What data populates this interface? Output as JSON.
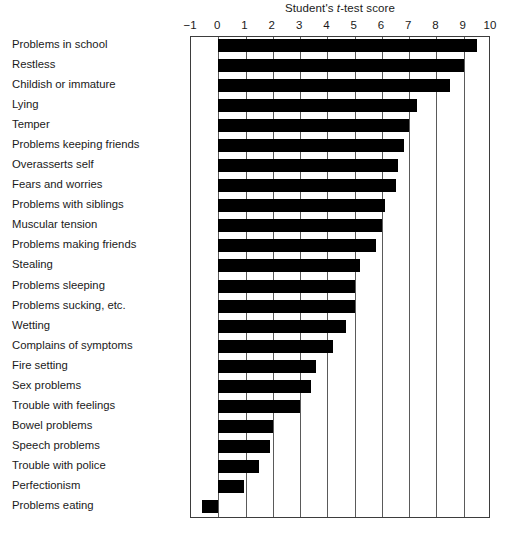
{
  "chart_data": {
    "type": "bar",
    "orientation": "horizontal",
    "title": "Student's t-test score",
    "title_parts": {
      "before": "Student's ",
      "italic": "t",
      "after": "-test score"
    },
    "xlabel": "Student's t-test score",
    "ylabel": "",
    "xlim": [
      -1,
      10
    ],
    "xticks": [
      -1,
      0,
      1,
      2,
      3,
      4,
      5,
      6,
      7,
      8,
      9,
      10
    ],
    "xtick_labels": [
      "−1",
      "0",
      "1",
      "2",
      "3",
      "4",
      "5",
      "6",
      "7",
      "8",
      "9",
      "10"
    ],
    "grid": "vertical",
    "legend": "none",
    "bar_color": "#000000",
    "categories": [
      "Problems in school",
      "Restless",
      "Childish or immature",
      "Lying",
      "Temper",
      "Problems keeping friends",
      "Overasserts self",
      "Fears and worries",
      "Problems with siblings",
      "Muscular tension",
      "Problems making friends",
      "Stealing",
      "Problems sleeping",
      "Problems sucking, etc.",
      "Wetting",
      "Complains of symptoms",
      "Fire setting",
      "Sex problems",
      "Trouble with feelings",
      "Bowel problems",
      "Speech problems",
      "Trouble with police",
      "Perfectionism",
      "Problems eating"
    ],
    "values": [
      9.5,
      9.0,
      8.5,
      7.3,
      7.0,
      6.8,
      6.6,
      6.5,
      6.1,
      6.0,
      5.8,
      5.2,
      5.0,
      5.0,
      4.7,
      4.2,
      3.6,
      3.4,
      3.0,
      2.0,
      1.9,
      1.5,
      0.95,
      -0.6
    ]
  }
}
